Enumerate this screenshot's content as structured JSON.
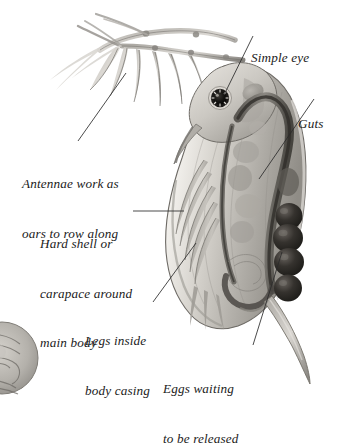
{
  "figure": {
    "style": "grayscale-scientific-illustration",
    "background_color": "#ffffff",
    "ink_color": "#1b1b1b",
    "body_fill_light": "#e8e6e2",
    "body_fill_mid": "#b7b4ae",
    "body_fill_dark": "#6e6b66",
    "egg_color": "#2b2925",
    "eye_color": "#100f0d",
    "leader_color": "#2a2a2a"
  },
  "labels": [
    {
      "id": "simple-eye",
      "lines": [
        "Simple eye"
      ],
      "align": "left",
      "x": 251,
      "y": 17,
      "leader": {
        "x1": 253,
        "y1": 36,
        "x2": 224,
        "y2": 95
      }
    },
    {
      "id": "guts",
      "lines": [
        "Guts"
      ],
      "align": "left",
      "x": 298,
      "y": 83,
      "leader": {
        "x1": 314,
        "y1": 99,
        "x2": 259,
        "y2": 179
      }
    },
    {
      "id": "antennae",
      "lines": [
        "Antennae work as",
        "oars to row along"
      ],
      "align": "left",
      "x": 22,
      "y": 143,
      "leader": {
        "x1": 126,
        "y1": 73,
        "x2": 78,
        "y2": 141
      }
    },
    {
      "id": "carapace",
      "lines": [
        "Hard shell or",
        "carapace around",
        "main body"
      ],
      "align": "left",
      "x": 40,
      "y": 203,
      "leader": {
        "x1": 133,
        "y1": 211,
        "x2": 184,
        "y2": 211
      }
    },
    {
      "id": "legs",
      "lines": [
        "Legs inside",
        "body casing"
      ],
      "align": "left",
      "x": 85,
      "y": 300,
      "leader": {
        "x1": 153,
        "y1": 302,
        "x2": 196,
        "y2": 243
      }
    },
    {
      "id": "eggs",
      "lines": [
        "Eggs waiting",
        "to be released"
      ],
      "align": "left",
      "x": 163,
      "y": 348,
      "leader": {
        "x1": 253,
        "y1": 345,
        "x2": 282,
        "y2": 252
      }
    }
  ],
  "anatomy": {
    "eggs_count": 4,
    "eye_count": 1,
    "antennae_branches": 2,
    "parts": [
      "antennae",
      "simple-eye",
      "carapace",
      "guts",
      "legs",
      "eggs",
      "tail-spine"
    ]
  },
  "secondary_object": {
    "id": "cropped-specimen",
    "x": 0,
    "y": 322,
    "radius": 30
  }
}
